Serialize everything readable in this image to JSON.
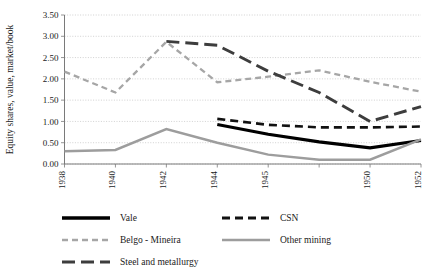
{
  "chart_data": {
    "type": "line",
    "title": "",
    "xlabel": "",
    "ylabel": "Equity shares, value, market/book",
    "ylim": [
      0.0,
      3.5
    ],
    "ytick_step": 0.5,
    "ytick_labels": [
      "0.00",
      "0.50",
      "1.00",
      "1.50",
      "2.00",
      "2.50",
      "3.00",
      "3.50"
    ],
    "ytick_values": [
      0.0,
      0.5,
      1.0,
      1.5,
      2.0,
      2.5,
      3.0,
      3.5
    ],
    "grid": true,
    "legend_position": "below-left",
    "x": [
      1938,
      1940,
      1942,
      1944,
      1945,
      1946,
      1950,
      1952
    ],
    "categories": [
      "1938",
      "1940",
      "1942",
      "1944",
      "1945",
      "",
      "1950",
      "1952"
    ],
    "tick_labels_shown": [
      "1938",
      "1940",
      "1942",
      "1944",
      "1945",
      "1950",
      "1952"
    ],
    "series": [
      {
        "name": "Vale",
        "color": "#000000",
        "width": 3.1,
        "dash": "none",
        "values": [
          null,
          null,
          null,
          0.93,
          0.7,
          0.52,
          0.38,
          0.55
        ]
      },
      {
        "name": "CSN",
        "color": "#111111",
        "width": 2.6,
        "dash": "8 5",
        "values": [
          null,
          null,
          null,
          1.06,
          0.92,
          0.86,
          0.86,
          0.88
        ]
      },
      {
        "name": "Belgo - Mineira",
        "color": "#a6a6a6",
        "width": 2.3,
        "dash": "6 4",
        "values": [
          2.17,
          1.68,
          2.87,
          1.92,
          2.05,
          2.2,
          1.93,
          1.7
        ]
      },
      {
        "name": "Other mining",
        "color": "#9d9d9d",
        "width": 2.5,
        "dash": "none",
        "values": [
          0.3,
          0.33,
          0.82,
          0.5,
          0.22,
          0.1,
          0.1,
          0.58
        ]
      },
      {
        "name": "Steel and metallurgy",
        "color": "#3d3d3d",
        "width": 2.9,
        "dash": "13 6",
        "values": [
          null,
          null,
          2.88,
          2.79,
          2.18,
          1.68,
          1.0,
          1.35
        ]
      }
    ],
    "legend": [
      {
        "label": "Vale",
        "color": "#000000",
        "dash": "none",
        "width": 3.4
      },
      {
        "label": "CSN",
        "color": "#111111",
        "dash": "8 5",
        "width": 2.8
      },
      {
        "label": "Belgo - Mineira",
        "color": "#a6a6a6",
        "dash": "6 4",
        "width": 2.6
      },
      {
        "label": "Other mining",
        "color": "#9d9d9d",
        "dash": "none",
        "width": 2.6
      },
      {
        "label": "Steel and metallurgy",
        "color": "#3d3d3d",
        "dash": "13 6",
        "width": 3.0
      }
    ]
  }
}
